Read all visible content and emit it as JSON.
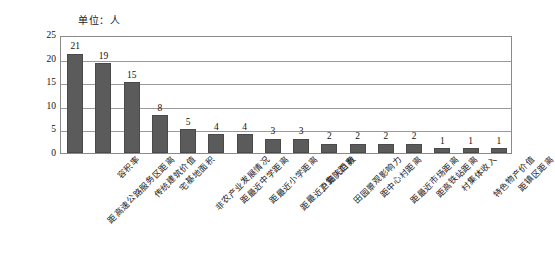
{
  "figure": {
    "unit_caption": "单位：人",
    "bar_color": "#5b5b5b",
    "grid_color": "#9a9a9a",
    "frame_color": "#8a8a8a"
  },
  "chart_data": {
    "type": "bar",
    "title": "",
    "subtitle": "",
    "annotation": "单位：人",
    "xlabel": "",
    "ylabel": "",
    "ylim": [
      0,
      25
    ],
    "yticks": [
      0,
      5,
      10,
      15,
      20,
      25
    ],
    "grid": true,
    "legend": false,
    "orientation": "vertical",
    "categories": [
      "距高速公路服务区距离",
      "容积率",
      "传统建筑价值",
      "宅基地面积",
      "非农产业发展情况",
      "距最近中学距离",
      "距最近小学距离",
      "距最近卫生院距离",
      "户籍人口数",
      "田园景观影响力",
      "距中心村距离",
      "距最近市场距离",
      "距高铁站距离",
      "村集体收入",
      "特色物产价值",
      "距镇区距离"
    ],
    "values": [
      21,
      19,
      15,
      8,
      5,
      4,
      4,
      3,
      3,
      2,
      2,
      2,
      2,
      1,
      1,
      1
    ],
    "data_labels": [
      "21",
      "19",
      "15",
      "8",
      "5",
      "4",
      "4",
      "3",
      "3",
      "2",
      "2",
      "2",
      "2",
      "1",
      "1",
      "1"
    ]
  }
}
